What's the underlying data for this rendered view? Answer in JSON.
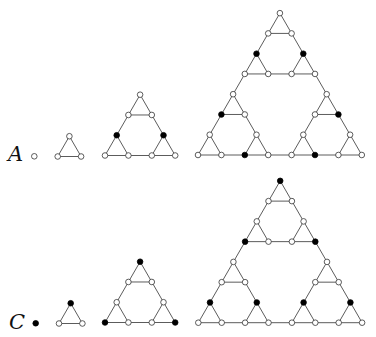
{
  "diagram": {
    "title": "",
    "unit_edge": 23.4,
    "node_radius": 2.8,
    "colors": {
      "edge": "#4a4a4a",
      "filled": "#000000",
      "hollow": "#ffffff",
      "outline": "#333333"
    },
    "rows": [
      {
        "label": "A",
        "label_pos": [
          8,
          161
        ],
        "figures": [
          {
            "level": 0,
            "origin": [
              34.3,
              156.3
            ],
            "filled": []
          },
          {
            "level": 1,
            "origin": [
              57.7,
              156.5
            ],
            "filled": []
          },
          {
            "level": 2,
            "origin": [
              105,
              155.5
            ],
            "filled": [
              "10",
              "20"
            ]
          },
          {
            "level": 3,
            "origin": [
              198,
              155
            ],
            "filled": [
              "010",
              "020",
              "101",
              "121",
              "202",
              "212"
            ]
          }
        ]
      },
      {
        "label": "C",
        "label_pos": [
          9,
          329
        ],
        "figures": [
          {
            "level": 0,
            "origin": [
              35.7,
              323.3
            ],
            "filled": [
              ""
            ]
          },
          {
            "level": 1,
            "origin": [
              59,
              323.5
            ],
            "filled": [
              "0"
            ]
          },
          {
            "level": 2,
            "origin": [
              105,
              322.5
            ],
            "filled": [
              "00",
              "11",
              "22"
            ]
          },
          {
            "level": 3,
            "origin": [
              198.3,
              322.7
            ],
            "filled": [
              "000",
              "011",
              "022",
              "110",
              "120",
              "210",
              "220"
            ]
          }
        ]
      }
    ]
  }
}
